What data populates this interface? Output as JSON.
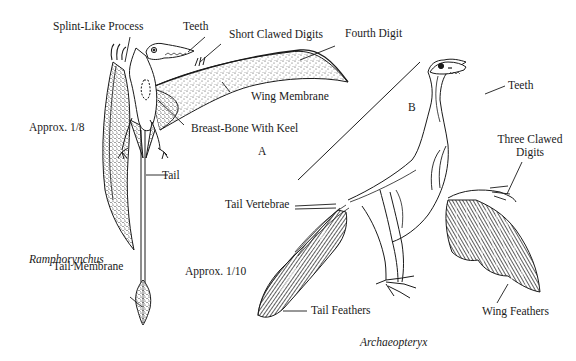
{
  "figure": {
    "panel_a": {
      "letter": "A",
      "species": "Ramphorynchus",
      "scale": "Approx. 1/8",
      "labels": {
        "splint_like_process": "Splint-Like Process",
        "teeth": "Teeth",
        "short_clawed_digits": "Short Clawed Digits",
        "fourth_digit": "Fourth Digit",
        "wing_membrane": "Wing Membrane",
        "breast_bone": "Breast-Bone With Keel",
        "tail": "Tail",
        "tail_membrane": "Tail Membrane"
      }
    },
    "panel_b": {
      "letter": "B",
      "species": "Archaeopteryx",
      "scale": "Approx. 1/10",
      "labels": {
        "teeth": "Teeth",
        "three_clawed_digits_line1": "Three Clawed",
        "three_clawed_digits_line2": "Digits",
        "tail_vertebrae": "Tail Vertebrae",
        "tail_feathers": "Tail Feathers",
        "wing_feathers": "Wing Feathers"
      }
    },
    "colors": {
      "ink": "#1a1a1a",
      "paper": "#ffffff",
      "stipple": "#6b6b6b"
    }
  }
}
